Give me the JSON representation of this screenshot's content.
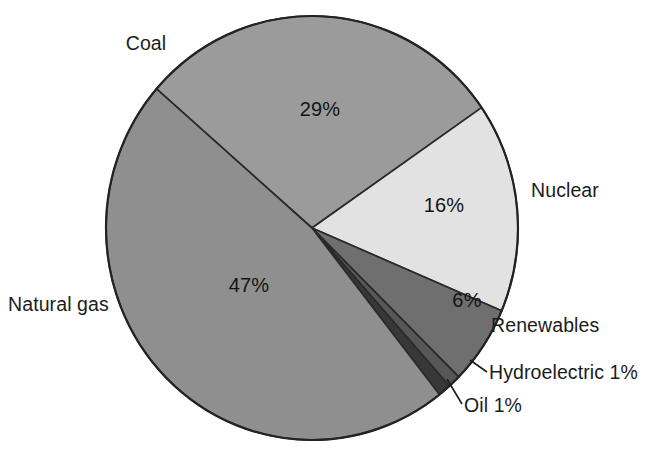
{
  "chart_data": {
    "type": "pie",
    "title": "",
    "subtitle": "",
    "xlabel": "",
    "ylabel": "",
    "legend_position": "none",
    "grid": false,
    "unit": "percent",
    "total": 100,
    "categories": [
      "Natural gas",
      "Coal",
      "Nuclear",
      "Renewables",
      "Hydroelectric",
      "Oil"
    ],
    "values": [
      47,
      29,
      16,
      6,
      1,
      1
    ],
    "slices": [
      {
        "name": "Coal",
        "value": 29,
        "value_label": "29%",
        "color": "#9b9b9b",
        "label_text": "Coal",
        "label_position": "outside-upper-left",
        "value_label_inside": true,
        "leader_line": false
      },
      {
        "name": "Nuclear",
        "value": 16,
        "value_label": "16%",
        "color": "#e2e2e2",
        "label_text": "Nuclear",
        "label_position": "outside-right",
        "value_label_inside": true,
        "leader_line": false
      },
      {
        "name": "Renewables",
        "value": 6,
        "value_label": "6%",
        "color": "#6f6f6f",
        "label_text": "Renewables",
        "label_position": "outside-lower-right",
        "value_label_inside": true,
        "leader_line": false
      },
      {
        "name": "Hydroelectric",
        "value": 1,
        "value_label": "1%",
        "color": "#575757",
        "label_text": "Hydroelectric 1%",
        "label_position": "outside-lower-right",
        "value_label_inside": false,
        "leader_line": true
      },
      {
        "name": "Oil",
        "value": 1,
        "value_label": "1%",
        "color": "#383838",
        "label_text": "Oil 1%",
        "label_position": "outside-bottom-right",
        "value_label_inside": false,
        "leader_line": true
      },
      {
        "name": "Natural gas",
        "value": 47,
        "value_label": "47%",
        "color": "#8f8f8f",
        "label_text": "Natural gas",
        "label_position": "outside-left",
        "value_label_inside": true,
        "leader_line": false
      }
    ]
  },
  "labels": {
    "coal": "Coal",
    "nuclear": "Nuclear",
    "renewables": "Renewables",
    "hydroelectric": "Hydroelectric 1%",
    "oil": "Oil 1%",
    "natural_gas": "Natural gas"
  },
  "value_labels": {
    "coal": "29%",
    "nuclear": "16%",
    "renewables": "6%",
    "natural_gas": "47%"
  },
  "colors": {
    "coal": "#9b9b9b",
    "nuclear": "#e2e2e2",
    "renewables": "#6f6f6f",
    "hydroelectric": "#575757",
    "oil": "#383838",
    "natural_gas": "#8f8f8f",
    "outline": "#232323",
    "text": "#1c1c1c",
    "background": "#ffffff"
  }
}
